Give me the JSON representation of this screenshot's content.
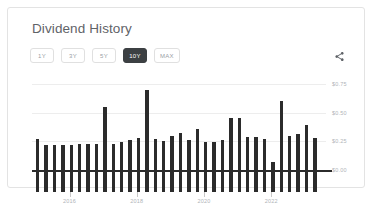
{
  "card": {
    "title": "Dividend History"
  },
  "toolbar": {
    "ranges": [
      {
        "label": "1Y",
        "selected": false
      },
      {
        "label": "3Y",
        "selected": false
      },
      {
        "label": "5Y",
        "selected": false
      },
      {
        "label": "10Y",
        "selected": true
      },
      {
        "label": "MAX",
        "selected": false
      }
    ],
    "share_icon": "share-icon"
  },
  "colors": {
    "bar": "#2b2b2b",
    "selected_button_bg": "#3c4043",
    "gridline": "#ededed",
    "axis_text": "#b0b4b8",
    "title_text": "#5f6368",
    "card_border": "#e3e3e3"
  },
  "chart_data": {
    "type": "bar",
    "title": "Dividend History",
    "xlabel": "",
    "ylabel": "",
    "ylim": [
      0.0,
      0.78
    ],
    "ytick_labels": [
      "$0.75",
      "$0.50",
      "$0.25",
      "$0.00"
    ],
    "ytick_values": [
      0.75,
      0.5,
      0.25,
      0.0
    ],
    "xtick_labels": [
      "2016",
      "2018",
      "2020",
      "2022"
    ],
    "xtick_values": [
      2016,
      2018,
      2020,
      2022
    ],
    "grid": true,
    "legend": "none",
    "series_name": "Dividend per share",
    "x": [
      2015.05,
      2015.3,
      2015.55,
      2015.8,
      2016.05,
      2016.3,
      2016.55,
      2016.8,
      2017.05,
      2017.3,
      2017.55,
      2017.8,
      2018.05,
      2018.3,
      2018.55,
      2018.8,
      2019.05,
      2019.3,
      2019.55,
      2019.8,
      2020.05,
      2020.3,
      2020.55,
      2020.8,
      2021.05,
      2021.3,
      2021.55,
      2021.8,
      2022.05,
      2022.3,
      2022.55,
      2022.8,
      2023.05,
      2023.3
    ],
    "values": [
      0.27,
      0.22,
      0.22,
      0.22,
      0.22,
      0.23,
      0.23,
      0.23,
      0.55,
      0.23,
      0.24,
      0.26,
      0.28,
      0.7,
      0.27,
      0.25,
      0.3,
      0.32,
      0.26,
      0.36,
      0.24,
      0.24,
      0.26,
      0.45,
      0.45,
      0.29,
      0.29,
      0.27,
      0.07,
      0.6,
      0.3,
      0.31,
      0.39,
      0.28
    ]
  }
}
